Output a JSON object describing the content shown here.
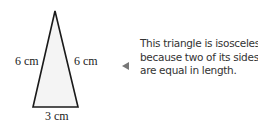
{
  "diagram": {
    "shape": "isosceles triangle",
    "fill_color": "#f4f4f4",
    "stroke_color": "#1a1a1a",
    "sides": {
      "left": "6 cm",
      "right": "6 cm",
      "base": "3 cm"
    }
  },
  "callout": {
    "pointer_icon": "triangle-left-pointer",
    "pointer_color": "#777777",
    "lines": [
      "This triangle is isosceles",
      "because two of its sides",
      "are equal in length."
    ]
  }
}
